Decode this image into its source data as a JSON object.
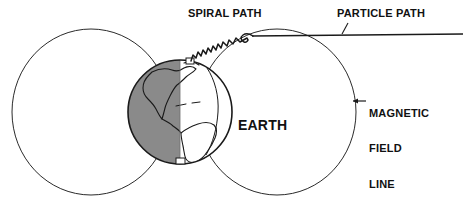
{
  "diagram": {
    "background_color": "#ffffff",
    "stroke_color": "#1a1a1a",
    "shaded_hemisphere_color": "#8a8a8a",
    "lit_hemisphere_color": "#ffffff",
    "labels": {
      "spiral_path": "SPIRAL PATH",
      "particle_path": "PARTICLE PATH",
      "earth": "EARTH",
      "magnetic_field_line_1": "MAGNETIC",
      "magnetic_field_line_2": "FIELD",
      "magnetic_field_line_3": "LINE"
    },
    "elements": {
      "left_field_loop": "left magnetic field line circle",
      "right_field_loop": "right magnetic field line circle",
      "earth_globe": "earth globe with americas and day night terminator",
      "particle_path_line": "incoming particle path straight line",
      "spiral_path_line": "helical spiral path descending to north pole",
      "field_line_arrow": "leader arrow pointing to magnetic field line",
      "particle_path_leader": "leader tick pointing to particle path line",
      "north_pole_marker": "north polar cap marker",
      "south_pole_marker": "south polar cap marker"
    }
  }
}
